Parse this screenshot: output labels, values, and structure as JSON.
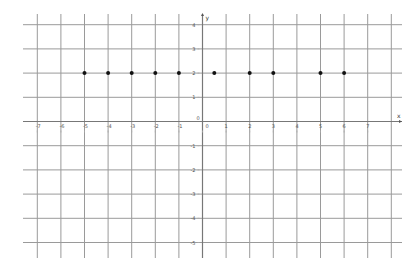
{
  "chart_data": {
    "type": "scatter",
    "title": "",
    "xlabel": "x",
    "ylabel": "y",
    "xlim": [
      -7.6,
      8
    ],
    "ylim": [
      -5.5,
      4.4
    ],
    "grid": true,
    "x_ticks": [
      -7,
      -6,
      -5,
      -4,
      -3,
      -2,
      -1,
      0,
      1,
      2,
      3,
      4,
      5,
      6,
      7
    ],
    "y_ticks": [
      -5,
      -4,
      -3,
      -2,
      -1,
      0,
      1,
      2,
      3,
      4
    ],
    "x_tick_labels": [
      "-7",
      "-6",
      "-5",
      "-4",
      "-3",
      "-2",
      "-1",
      "0",
      "1",
      "2",
      "3",
      "4",
      "5",
      "6",
      "7"
    ],
    "y_tick_labels": [
      "-5",
      "-4",
      "-3",
      "-2",
      "-1",
      "0",
      "1",
      "2",
      "3",
      "4"
    ],
    "series": [
      {
        "name": "points",
        "x": [
          -5,
          -4,
          -3,
          -2,
          -1,
          0.5,
          2,
          3,
          5,
          6
        ],
        "y": [
          2,
          2,
          2,
          2,
          2,
          2,
          2,
          2,
          2,
          2
        ]
      }
    ],
    "colors": {
      "grid": "#9a9a9a",
      "axis": "#777777",
      "point": "#111111"
    }
  }
}
